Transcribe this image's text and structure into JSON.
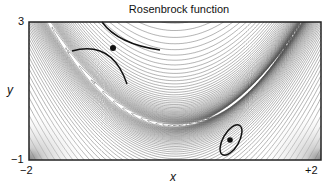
{
  "chart_data": {
    "type": "contour",
    "title": "Rosenbrock function",
    "function": "f(x,y) = (1 - x)^2 + 100 (y - x^2)^2",
    "xlabel": "x",
    "ylabel": "y",
    "xlim": [
      -2,
      2
    ],
    "ylim": [
      -1,
      3
    ],
    "x_ticks": [
      "-2",
      "+2"
    ],
    "y_ticks": [
      "-1",
      "3"
    ],
    "annotations": [
      {
        "type": "point",
        "x": -0.9,
        "y": 2.3,
        "description": "saddle-like point with two hyperbola-like curves"
      },
      {
        "type": "point",
        "x": 1.0,
        "y": 1.0,
        "description": "minimum enclosed by ellipse"
      }
    ],
    "grid": false,
    "legend": null
  },
  "labels": {
    "title": "Rosenbrock function",
    "xlabel": "x",
    "ylabel": "y",
    "x_min": "−2",
    "x_max": "+2",
    "y_min": "−1",
    "y_max": "3"
  }
}
